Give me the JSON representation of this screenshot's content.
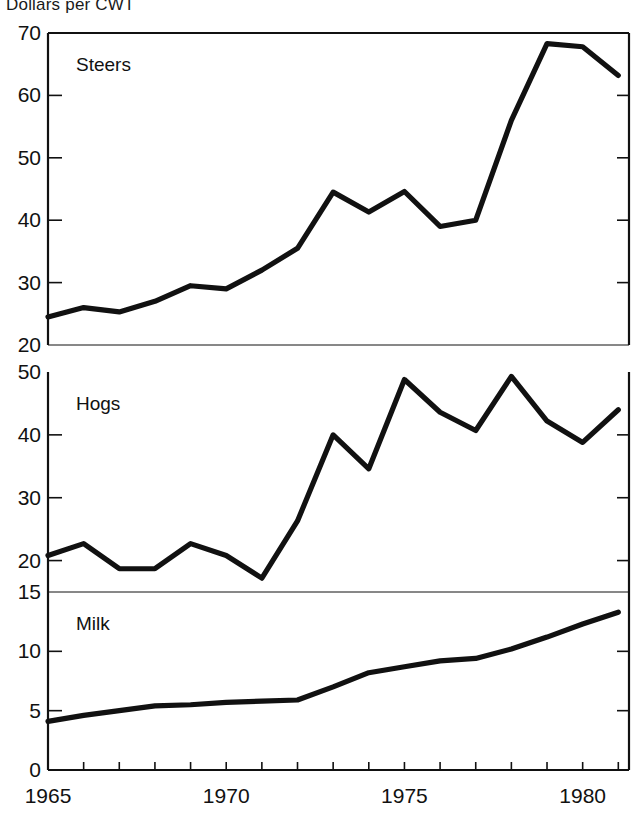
{
  "figure": {
    "title": "Dollars per CWT",
    "title_clipped": true,
    "background": "#ffffff",
    "line_color": "#111111",
    "axis_color": "#111111"
  },
  "chart_data": {
    "type": "line",
    "title": "Dollars per CWT",
    "xlabel": "",
    "ylabel": "Dollars per CWT",
    "grid": false,
    "legend": "inline-panel-labels",
    "x": [
      1965,
      1966,
      1967,
      1968,
      1969,
      1970,
      1971,
      1972,
      1973,
      1974,
      1975,
      1976,
      1977,
      1978,
      1979,
      1980,
      1981
    ],
    "xlim": [
      1965,
      1981.3
    ],
    "xticks": [
      1965,
      1966,
      1967,
      1968,
      1969,
      1970,
      1971,
      1972,
      1973,
      1974,
      1975,
      1976,
      1977,
      1978,
      1979,
      1980,
      1981
    ],
    "xticklabels": [
      "1965",
      "",
      "",
      "",
      "",
      "1970",
      "",
      "",
      "",
      "",
      "1975",
      "",
      "",
      "",
      "",
      "1980",
      ""
    ],
    "panels": [
      {
        "name": "Steers",
        "label": "Steers",
        "ylim": [
          20,
          70
        ],
        "yticks": [
          20,
          30,
          40,
          50,
          60,
          70
        ],
        "yticklabels": [
          "20",
          "30",
          "40",
          "50",
          "60",
          "70"
        ],
        "values": [
          24.5,
          26.0,
          25.3,
          27.0,
          29.5,
          29.0,
          32.0,
          35.5,
          44.5,
          41.3,
          44.6,
          39.0,
          40.0,
          56.0,
          68.3,
          67.8,
          63.2
        ]
      },
      {
        "name": "Hogs",
        "label": "Hogs",
        "ylim": [
          15,
          50
        ],
        "yticks": [
          20,
          30,
          40,
          50
        ],
        "yticklabels": [
          "20",
          "30",
          "40",
          "50"
        ],
        "values": [
          20.8,
          22.7,
          18.7,
          18.7,
          22.7,
          20.8,
          17.2,
          26.3,
          40.0,
          34.6,
          48.8,
          43.6,
          40.7,
          49.3,
          42.2,
          38.8,
          44.0
        ]
      },
      {
        "name": "Milk",
        "label": "Milk",
        "ylim": [
          0,
          15
        ],
        "yticks": [
          0,
          5,
          10,
          15
        ],
        "yticklabels": [
          "0",
          "5",
          "10",
          "15"
        ],
        "values": [
          4.1,
          4.6,
          5.0,
          5.4,
          5.5,
          5.7,
          5.8,
          5.9,
          7.0,
          8.2,
          8.7,
          9.2,
          9.4,
          10.2,
          11.2,
          12.3,
          13.3
        ]
      }
    ]
  }
}
